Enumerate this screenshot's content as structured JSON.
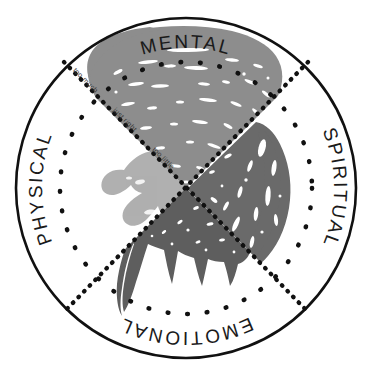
{
  "canvas": {
    "width": 373,
    "height": 375,
    "background": "#ffffff"
  },
  "circle": {
    "outer_stroke_color": "#111111",
    "outer_stroke_width": 2.6,
    "inner_dotted_color": "#111111",
    "center_x": 186,
    "center_y": 188,
    "outer_radius": 172,
    "inner_dotted_radius": 126
  },
  "quadrant_labels": {
    "top": "MENTAL",
    "right": "SPIRITUAL",
    "bottom": "EMOTIONAL",
    "left": "PHYSICAL"
  },
  "axis_labels": {
    "outer": "too much",
    "middle": "just right",
    "inner": "too little"
  },
  "dividers": {
    "style": "dotted",
    "color": "#111111",
    "count": 2,
    "orientation": "diagonal"
  },
  "shapes": [
    {
      "name": "mental-shape",
      "quadrant": "top",
      "fill": "#8d8d8d",
      "description": "large fan-shaped brush mass with white streak marks"
    },
    {
      "name": "spiritual-shape",
      "quadrant": "right",
      "fill": "#6a6a6a",
      "description": "rounded wedge with white flecks"
    },
    {
      "name": "emotional-shape",
      "quadrant": "bottom",
      "fill": "#5e5e5e",
      "description": "spiky dripping triangular mass"
    },
    {
      "name": "physical-shape",
      "quadrant": "left",
      "fill": "#b0b0b0",
      "description": "light hand-like form with finger projections"
    }
  ],
  "colors": {
    "ink": "#111111",
    "light_gray": "#b0b0b0",
    "medium_gray": "#8d8d8d",
    "dark_gray": "#6a6a6a",
    "darkest_gray": "#5e5e5e",
    "paper": "#ffffff"
  }
}
